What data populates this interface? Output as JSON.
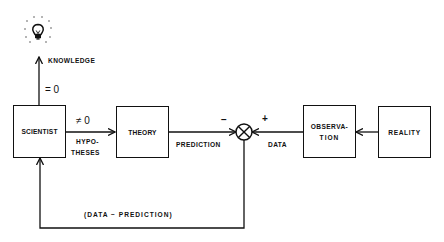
{
  "diagram": {
    "type": "feedback-loop block diagram",
    "blocks": {
      "scientist": "SCIENTIST",
      "theory": "THEORY",
      "observation_line1": "OBSERVA-",
      "observation_line2": "TION",
      "reality": "REALITY"
    },
    "edges": {
      "knowledge": "KNOWLEDGE",
      "knowledge_condition": "= 0",
      "hypotheses_condition": "≠ 0",
      "hypotheses_line1": "HYPO-",
      "hypotheses_line2": "THESES",
      "prediction": "PREDICTION",
      "data": "DATA",
      "feedback": "(DATA  −  PREDICTION)"
    },
    "comparator": {
      "minus_sign": "−",
      "plus_sign": "+"
    },
    "icons": {
      "top": "lightbulb-icon"
    },
    "colors": {
      "ink": "#111111",
      "background": "#ffffff"
    }
  }
}
